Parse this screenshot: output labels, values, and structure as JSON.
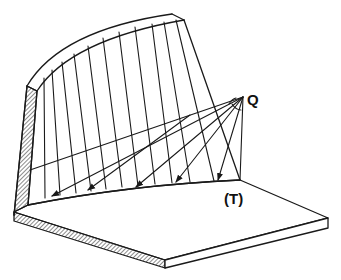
{
  "diagram": {
    "type": "perspective-sketch",
    "labels": {
      "point": "Q",
      "curve": "(T)"
    },
    "colors": {
      "stroke": "#1a1a1a",
      "background": "#ffffff"
    },
    "ray_count": 5,
    "generator_line_count": 12
  }
}
